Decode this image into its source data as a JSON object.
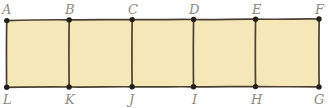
{
  "figure": {
    "kind": "geometry-diagram",
    "colors": {
      "fill": "#F6E7B8",
      "stroke": "#4a4031",
      "vertex_dot": "#241f19",
      "label_text": "#8f8a80",
      "background": "#ffffff"
    },
    "geometry": {
      "top_y": 20,
      "bottom_y": 87,
      "x_positions": [
        6,
        69,
        132,
        193,
        255,
        319
      ],
      "cell_count": 5
    },
    "top_labels": [
      {
        "text": "A",
        "x": 6,
        "y": 3
      },
      {
        "text": "B",
        "x": 69,
        "y": 3
      },
      {
        "text": "C",
        "x": 132,
        "y": 3
      },
      {
        "text": "D",
        "x": 193,
        "y": 3
      },
      {
        "text": "E",
        "x": 255,
        "y": 3
      },
      {
        "text": "F",
        "x": 319,
        "y": 3
      }
    ],
    "bottom_labels": [
      {
        "text": "L",
        "x": 6,
        "y": 93
      },
      {
        "text": "K",
        "x": 69,
        "y": 93
      },
      {
        "text": "J",
        "x": 132,
        "y": 93
      },
      {
        "text": "I",
        "x": 193,
        "y": 93
      },
      {
        "text": "H",
        "x": 255,
        "y": 93
      },
      {
        "text": "G",
        "x": 319,
        "y": 93
      }
    ]
  }
}
